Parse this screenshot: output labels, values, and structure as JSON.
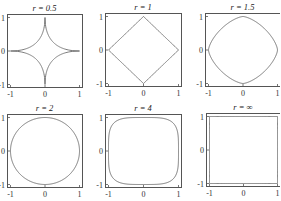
{
  "chart_data": [
    {
      "type": "line",
      "title": "r = 0.5",
      "r": 0.5,
      "xlim": [
        -1,
        1
      ],
      "ylim": [
        -1,
        1
      ],
      "xticks": [
        "-1",
        "0",
        "1"
      ],
      "yticks": [
        "-1",
        "0",
        "1"
      ],
      "curve": "|x|^0.5 + |y|^0.5 = 1 (astroid-like)"
    },
    {
      "type": "line",
      "title": "r = 1",
      "r": 1,
      "xlim": [
        -1,
        1
      ],
      "ylim": [
        -1,
        1
      ],
      "xticks": [
        "-1",
        "0",
        "1"
      ],
      "yticks": [
        "-1",
        "0",
        "1"
      ],
      "curve": "|x| + |y| = 1 (diamond)"
    },
    {
      "type": "line",
      "title": "r = 1.5",
      "r": 1.5,
      "xlim": [
        -1,
        1
      ],
      "ylim": [
        -1,
        1
      ],
      "xticks": [
        "-1",
        "0",
        "1"
      ],
      "yticks": [
        "-1",
        "0",
        "1"
      ],
      "curve": "|x|^1.5 + |y|^1.5 = 1"
    },
    {
      "type": "line",
      "title": "r = 2",
      "r": 2,
      "xlim": [
        -1,
        1
      ],
      "ylim": [
        -1,
        1
      ],
      "xticks": [
        "-1",
        "0",
        "1"
      ],
      "yticks": [
        "-1",
        "0",
        "1"
      ],
      "curve": "x^2 + y^2 = 1 (circle)"
    },
    {
      "type": "line",
      "title": "r = 4",
      "r": 4,
      "xlim": [
        -1,
        1
      ],
      "ylim": [
        -1,
        1
      ],
      "xticks": [
        "-1",
        "0",
        "1"
      ],
      "yticks": [
        "-1",
        "0",
        "1"
      ],
      "curve": "x^4 + y^4 = 1 (squircle)"
    },
    {
      "type": "line",
      "title": "r = ∞",
      "r": "inf",
      "xlim": [
        -1,
        1
      ],
      "ylim": [
        -1,
        1
      ],
      "xticks": [
        "-1",
        "0",
        "1"
      ],
      "yticks": [
        "-1",
        "0",
        "1"
      ],
      "curve": "max(|x|,|y|) = 1 (square)"
    }
  ],
  "panels": [
    {
      "title": "r = 0.5",
      "r": 0.5,
      "x": 7,
      "y": 14,
      "w": 75,
      "h": 73
    },
    {
      "title": "r = 1",
      "r": 1,
      "x": 105,
      "y": 13,
      "w": 76,
      "h": 73
    },
    {
      "title": "r = 1.5",
      "r": 1.5,
      "x": 205,
      "y": 13,
      "w": 75,
      "h": 73
    },
    {
      "title": "r = 2",
      "r": 2,
      "x": 7,
      "y": 114,
      "w": 75,
      "h": 73
    },
    {
      "title": "r = 4",
      "r": 4,
      "x": 105,
      "y": 114,
      "w": 76,
      "h": 73
    },
    {
      "title": "r = ∞",
      "r": 1000,
      "x": 206,
      "y": 113,
      "w": 74,
      "h": 73
    }
  ],
  "ticks": {
    "x": [
      "-1",
      "0",
      "1"
    ],
    "y": [
      "1",
      "0",
      "-1"
    ]
  },
  "colors": {
    "frame": "#555555",
    "curve": "#6a6a6a",
    "text": "#222222"
  }
}
